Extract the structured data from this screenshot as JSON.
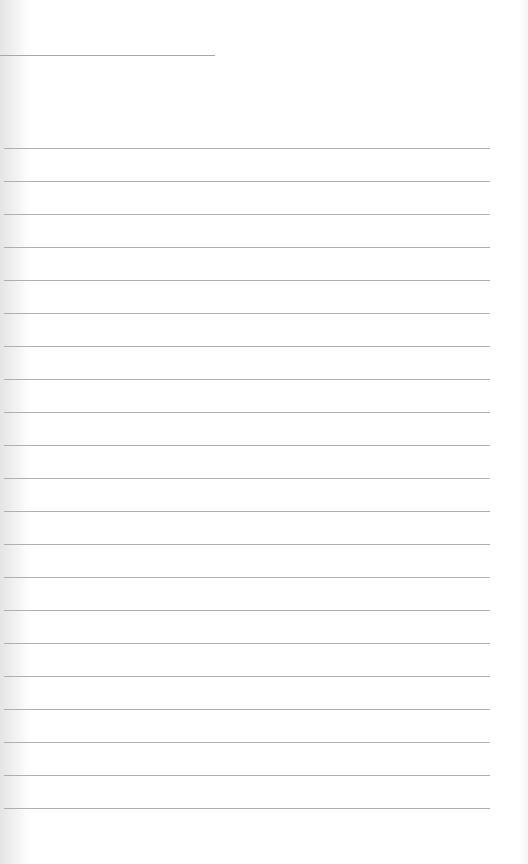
{
  "page": {
    "type": "lined-notepad",
    "title_line": {
      "y": 55,
      "x_end": 215
    },
    "ruled_lines": {
      "count": 21,
      "first_y": 148,
      "spacing": 33,
      "x_end": 490
    },
    "colors": {
      "background": "#ffffff",
      "line": "#b0b0b0"
    }
  }
}
